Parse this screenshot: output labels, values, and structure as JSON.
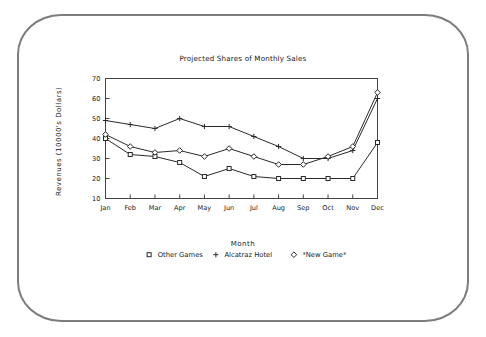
{
  "chart_data": {
    "type": "line",
    "title": "Projected Shares of Monthly Sales",
    "xlabel": "Month",
    "ylabel": "Revenues (10000's Dollars)",
    "categories": [
      "Jan",
      "Feb",
      "Mar",
      "Apr",
      "May",
      "Jun",
      "Jul",
      "Aug",
      "Sep",
      "Oct",
      "Nov",
      "Dec"
    ],
    "ylim": [
      10,
      70
    ],
    "yticks": [
      10,
      20,
      30,
      40,
      50,
      60,
      70
    ],
    "grid": false,
    "legend_position": "bottom",
    "series": [
      {
        "name": "Other Games",
        "marker": "square",
        "values": [
          40,
          32,
          31,
          28,
          21,
          25,
          21,
          20,
          20,
          20,
          20,
          38
        ]
      },
      {
        "name": "Alcatraz Hotel",
        "marker": "plus",
        "values": [
          49,
          47,
          45,
          50,
          46,
          46,
          41,
          36,
          30,
          30,
          34,
          60
        ]
      },
      {
        "name": "*New Game*",
        "marker": "diamond",
        "values": [
          42,
          36,
          33,
          34,
          31,
          35,
          31,
          27,
          27,
          31,
          36,
          63
        ]
      }
    ]
  },
  "legend": {
    "items": [
      {
        "label": "Other Games",
        "marker": "square-marker"
      },
      {
        "label": "Alcatraz Hotel",
        "marker": "plus-marker"
      },
      {
        "label": "*New Game*",
        "marker": "diamond-marker"
      }
    ]
  }
}
